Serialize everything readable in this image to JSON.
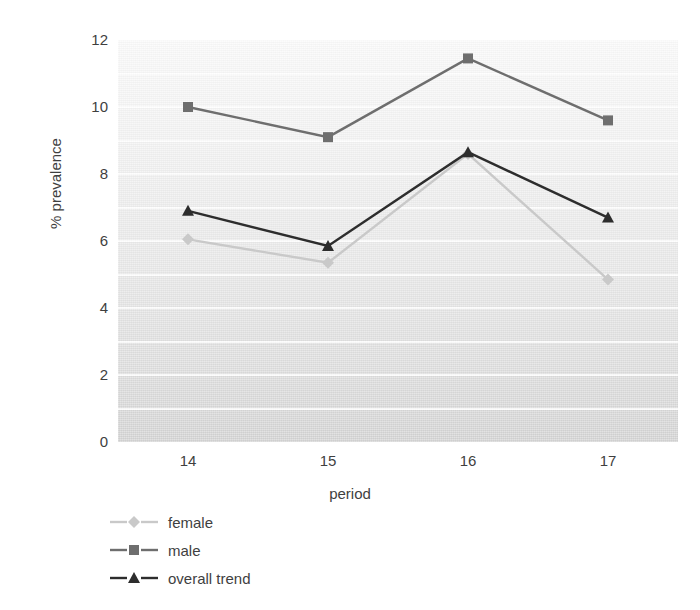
{
  "chart_data": {
    "type": "line",
    "title": "",
    "xlabel": "period",
    "ylabel": "% prevalence",
    "categories": [
      "14",
      "15",
      "16",
      "17"
    ],
    "x": [
      14,
      15,
      16,
      17
    ],
    "ylim": [
      0,
      12
    ],
    "xlim": [
      13.5,
      17.5
    ],
    "y_ticks": [
      0,
      2,
      4,
      6,
      8,
      10,
      12
    ],
    "y_tick_labels": [
      "0",
      "2",
      "4",
      "6",
      "8",
      "10",
      "12"
    ],
    "grid": "horizontal-white-major-and-minor",
    "legend_position": "below-left",
    "series": [
      {
        "name": "female",
        "values": [
          6.05,
          5.35,
          8.6,
          4.85
        ],
        "color": "#c9c9c9",
        "marker": "diamond"
      },
      {
        "name": "male",
        "values": [
          10.0,
          9.1,
          11.45,
          9.6
        ],
        "color": "#6e6e6e",
        "marker": "square"
      },
      {
        "name": "overall trend",
        "values": [
          6.9,
          5.85,
          8.65,
          6.7
        ],
        "color": "#2d2d2d",
        "marker": "triangle"
      }
    ]
  },
  "legend": {
    "items": [
      {
        "label": "female"
      },
      {
        "label": "male"
      },
      {
        "label": "overall trend"
      }
    ]
  },
  "colors": {
    "female": "#c9c9c9",
    "male": "#6e6e6e",
    "overall_trend": "#2d2d2d",
    "gridline": "#ffffff",
    "text": "#3f3f3f",
    "page_background": "#ffffff"
  }
}
